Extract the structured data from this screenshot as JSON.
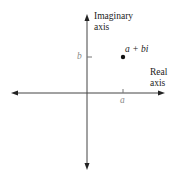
{
  "diagram": {
    "type": "complex-plane",
    "axes": {
      "vertical": {
        "label_line1": "Imaginary",
        "label_line2": "axis"
      },
      "horizontal": {
        "label_line1": "Real",
        "label_line2": "axis"
      }
    },
    "ticks": {
      "real_tick_label": "a",
      "imaginary_tick_label": "b"
    },
    "point": {
      "label": "a + bi"
    },
    "colors": {
      "axis": "#333333",
      "tick_label": "#8a8a8a",
      "text": "#222222",
      "point": "#111111"
    }
  }
}
